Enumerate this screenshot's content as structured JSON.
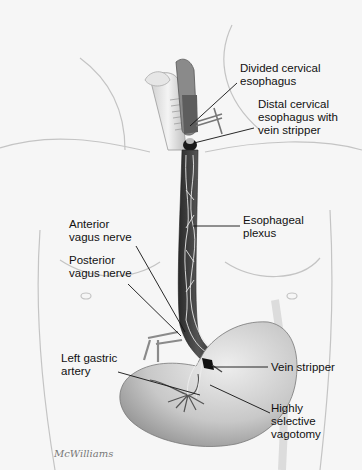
{
  "figure": {
    "labels": {
      "divided_cervical_esophagus": "Divided cervical\nesophagus",
      "distal_cervical_esophagus": "Distal cervical\nesophagus with\nvein stripper",
      "esophageal_plexus": "Esophageal\nplexus",
      "anterior_vagus_nerve": "Anterior\nvagus nerve",
      "posterior_vagus_nerve": "Posterior\nvagus nerve",
      "left_gastric_artery": "Left gastric\nartery",
      "vein_stripper": "Vein stripper",
      "highly_selective_vagotomy": "Highly\nselective\nvagotomy"
    },
    "signature": "McWilliams"
  },
  "colors": {
    "background": "#f6f6f6",
    "skin_outline": "#bdbdbd",
    "esophagus": "#3a3a3a",
    "stomach": "#c9c9c9",
    "nerve": "#e8e8e8",
    "leader_line": "#111111"
  }
}
